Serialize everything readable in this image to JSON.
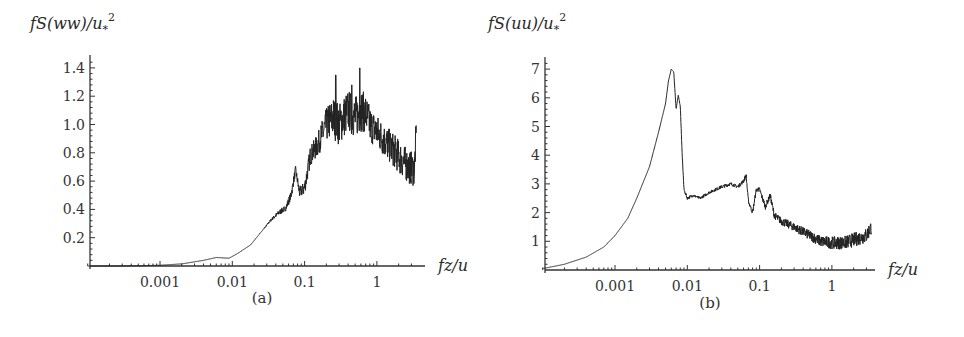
{
  "chart_data": [
    {
      "type": "line",
      "panel_label": "(a)",
      "title": "",
      "ylabel": "fS(ww)/u*^2",
      "ylabel_parts": {
        "main": "fS(ww)/u",
        "sub": "*",
        "sup": "2"
      },
      "xlabel": "fz/u",
      "xscale": "log",
      "xlim": [
        0.0001,
        3.5
      ],
      "ylim": [
        0,
        1.45
      ],
      "xticks": [
        0.001,
        0.01,
        0.1,
        1
      ],
      "xtick_labels": [
        "0.001",
        "0.01",
        "0.1",
        "1"
      ],
      "yticks": [
        0.2,
        0.4,
        0.6,
        0.8,
        1.0,
        1.2,
        1.4
      ],
      "ytick_labels": [
        "0.2",
        "0.4",
        "0.6",
        "0.8",
        "1.0",
        "1.2",
        "1.4"
      ],
      "grid": false,
      "legend": null,
      "series": [
        {
          "name": "w spectrum",
          "x": [
            0.0001,
            0.0003,
            0.001,
            0.002,
            0.004,
            0.006,
            0.009,
            0.012,
            0.018,
            0.025,
            0.035,
            0.045,
            0.055,
            0.065,
            0.075,
            0.085,
            0.1,
            0.12,
            0.15,
            0.2,
            0.25,
            0.3,
            0.4,
            0.5,
            0.6,
            0.7,
            0.8,
            1.0,
            1.3,
            1.7,
            2.2,
            2.8,
            3.3,
            3.5
          ],
          "y": [
            0.0,
            0.0,
            0.005,
            0.015,
            0.04,
            0.06,
            0.055,
            0.09,
            0.15,
            0.24,
            0.33,
            0.38,
            0.41,
            0.5,
            0.68,
            0.52,
            0.55,
            0.78,
            0.85,
            1.0,
            1.05,
            1.0,
            1.1,
            1.05,
            1.1,
            1.08,
            1.0,
            0.95,
            0.88,
            0.82,
            0.75,
            0.7,
            0.68,
            0.95
          ],
          "noise_amplitude": [
            0,
            0,
            0,
            0,
            0,
            0,
            0,
            0,
            0,
            0,
            0.01,
            0.02,
            0.02,
            0.03,
            0.03,
            0.04,
            0.05,
            0.07,
            0.08,
            0.12,
            0.15,
            0.15,
            0.15,
            0.15,
            0.15,
            0.14,
            0.13,
            0.12,
            0.12,
            0.12,
            0.12,
            0.12,
            0.12,
            0.1
          ],
          "spikes": [
            {
              "x": 0.27,
              "y": 1.35
            },
            {
              "x": 0.45,
              "y": 1.28
            },
            {
              "x": 0.58,
              "y": 1.4
            }
          ]
        }
      ]
    },
    {
      "type": "line",
      "panel_label": "(b)",
      "title": "",
      "ylabel": "fS(uu)/u*^2",
      "ylabel_parts": {
        "main": "fS(uu)/u",
        "sub": "*",
        "sup": "2"
      },
      "xlabel": "fz/u",
      "xscale": "log",
      "xlim": [
        0.0001,
        3.5
      ],
      "ylim": [
        0,
        7.2
      ],
      "xticks": [
        0.001,
        0.01,
        0.1,
        1
      ],
      "xtick_labels": [
        "0.001",
        "0.01",
        "0.1",
        "1"
      ],
      "yticks": [
        1,
        2,
        3,
        4,
        5,
        6,
        7
      ],
      "ytick_labels": [
        "1",
        "2",
        "3",
        "4",
        "5",
        "6",
        "7"
      ],
      "grid": false,
      "legend": null,
      "series": [
        {
          "name": "u spectrum",
          "x": [
            0.0001,
            0.0002,
            0.0004,
            0.0007,
            0.001,
            0.0015,
            0.002,
            0.003,
            0.004,
            0.005,
            0.0055,
            0.006,
            0.0065,
            0.007,
            0.0075,
            0.008,
            0.0085,
            0.009,
            0.01,
            0.012,
            0.015,
            0.02,
            0.03,
            0.04,
            0.05,
            0.06,
            0.065,
            0.07,
            0.08,
            0.09,
            0.1,
            0.12,
            0.14,
            0.16,
            0.2,
            0.3,
            0.5,
            0.7,
            1.0,
            1.5,
            2.0,
            3.0,
            3.5
          ],
          "y": [
            0.05,
            0.2,
            0.45,
            0.8,
            1.2,
            1.8,
            2.5,
            3.6,
            4.8,
            5.8,
            6.6,
            7.0,
            6.9,
            5.6,
            6.1,
            5.7,
            4.0,
            2.8,
            2.5,
            2.6,
            2.5,
            2.7,
            2.9,
            3.0,
            2.9,
            3.1,
            3.3,
            2.4,
            2.0,
            2.8,
            2.8,
            2.2,
            2.6,
            1.9,
            1.7,
            1.5,
            1.2,
            1.0,
            0.95,
            0.95,
            1.05,
            1.2,
            1.5
          ],
          "noise_amplitude": [
            0,
            0,
            0,
            0,
            0,
            0,
            0,
            0,
            0,
            0,
            0,
            0,
            0,
            0,
            0,
            0,
            0,
            0.05,
            0.05,
            0.05,
            0.05,
            0.05,
            0.06,
            0.06,
            0.06,
            0.07,
            0.07,
            0.07,
            0.07,
            0.08,
            0.08,
            0.1,
            0.1,
            0.12,
            0.14,
            0.15,
            0.18,
            0.2,
            0.22,
            0.24,
            0.25,
            0.26,
            0.26
          ],
          "spikes": []
        }
      ]
    }
  ],
  "figure": {
    "panel_a": {
      "ylabel_text": "fS(ww)/u",
      "ylabel_sub": "*",
      "ylabel_sup": "2",
      "xlabel_text": "fz/u",
      "caption": "(a)"
    },
    "panel_b": {
      "ylabel_text": "fS(uu)/u",
      "ylabel_sub": "*",
      "ylabel_sup": "2",
      "xlabel_text": "fz/u",
      "caption": "(b)"
    }
  }
}
